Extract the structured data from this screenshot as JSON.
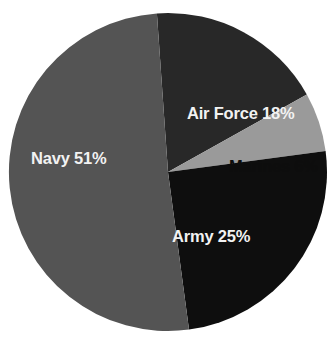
{
  "chart_data": {
    "type": "pie",
    "title": "",
    "subtitle": "",
    "xlabel": "",
    "ylabel": "",
    "legend_position": "none",
    "grid": false,
    "unit": "%",
    "categories": [
      "Air Force",
      "Marines",
      "Army",
      "Navy"
    ],
    "values": [
      18,
      6,
      25,
      51
    ],
    "labels": [
      "Air Force 18%",
      "Marines 6%",
      "Army 25%",
      "Navy 51%"
    ],
    "slices": [
      {
        "name": "Air Force",
        "value": 18,
        "label": "Air Force 18%",
        "color": "#282828",
        "text_color": "#f2f2f2",
        "start_angle_deg": 0,
        "end_angle_deg": 64.8
      },
      {
        "name": "Marines",
        "value": 6,
        "label": "Marines 6%",
        "color": "#9a9a9a",
        "text_color": "#0d0d0d",
        "start_angle_deg": 64.8,
        "end_angle_deg": 86.4
      },
      {
        "name": "Army",
        "value": 25,
        "label": "Army 25%",
        "color": "#0e0e0e",
        "text_color": "#f2f2f2",
        "start_angle_deg": 86.4,
        "end_angle_deg": 176.4
      },
      {
        "name": "Navy",
        "value": 51,
        "label": "Navy 51%",
        "color": "#545454",
        "text_color": "#f2f2f2",
        "start_angle_deg": 176.4,
        "end_angle_deg": 360
      }
    ],
    "geometry": {
      "center_x": 168,
      "center_y": 172,
      "radius": 159,
      "rotation_deg": -4
    },
    "colors": {
      "background": "#ffffff",
      "air_force": "#282828",
      "marines": "#9a9a9a",
      "army": "#0e0e0e",
      "navy": "#545454"
    }
  }
}
